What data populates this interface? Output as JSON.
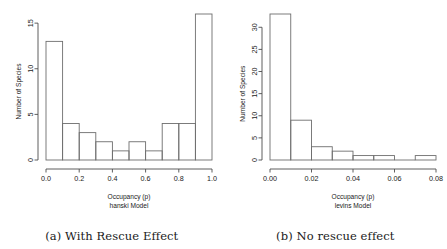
{
  "figure": {
    "panels": [
      {
        "id": "panel-a",
        "caption": "(a) With Rescue Effect",
        "xlabel_line1": "Occupancy (p)",
        "xlabel_line2": "hanski Model",
        "ylabel": "Number of Species"
      },
      {
        "id": "panel-b",
        "caption": "(b) No rescue effect",
        "xlabel_line1": "Occupancy (p)",
        "xlabel_line2": "levins Model",
        "ylabel": "Number of Species"
      }
    ]
  },
  "chart_data": [
    {
      "type": "bar",
      "subtype": "histogram",
      "title": "(a) With Rescue Effect",
      "xlabel": "Occupancy (p) hanski Model",
      "ylabel": "Number of Species",
      "xlim": [
        0.0,
        1.0
      ],
      "ylim": [
        0,
        16
      ],
      "xticks": [
        0.0,
        0.2,
        0.4,
        0.6,
        0.8,
        1.0
      ],
      "xticklabels": [
        "0.0",
        "0.2",
        "0.4",
        "0.6",
        "0.8",
        "1.0"
      ],
      "yticks": [
        0,
        5,
        10,
        15
      ],
      "yticklabels": [
        "0",
        "5",
        "10",
        "15"
      ],
      "grid": false,
      "legend": null,
      "bin_edges": [
        0.0,
        0.1,
        0.2,
        0.3,
        0.4,
        0.5,
        0.6,
        0.7,
        0.8,
        0.9,
        1.0
      ],
      "categories": [
        "0.0-0.1",
        "0.1-0.2",
        "0.2-0.3",
        "0.3-0.4",
        "0.4-0.5",
        "0.5-0.6",
        "0.6-0.7",
        "0.7-0.8",
        "0.8-0.9",
        "0.9-1.0"
      ],
      "values": [
        13,
        4,
        3,
        2,
        1,
        2,
        1,
        4,
        4,
        16
      ]
    },
    {
      "type": "bar",
      "subtype": "histogram",
      "title": "(b) No rescue effect",
      "xlabel": "Occupancy (p) levins Model",
      "ylabel": "Number of Species",
      "xlim": [
        0.0,
        0.08
      ],
      "ylim": [
        0,
        33
      ],
      "xticks": [
        0.0,
        0.02,
        0.04,
        0.06,
        0.08
      ],
      "xticklabels": [
        "0.00",
        "0.02",
        "0.04",
        "0.06",
        "0.08"
      ],
      "yticks": [
        0,
        5,
        10,
        15,
        20,
        25,
        30
      ],
      "yticklabels": [
        "0",
        "5",
        "10",
        "15",
        "20",
        "25",
        "30"
      ],
      "grid": false,
      "legend": null,
      "bin_edges": [
        0.0,
        0.01,
        0.02,
        0.03,
        0.04,
        0.05,
        0.06,
        0.07,
        0.08
      ],
      "categories": [
        "0.00-0.01",
        "0.01-0.02",
        "0.02-0.03",
        "0.03-0.04",
        "0.04-0.05",
        "0.05-0.06",
        "0.06-0.07",
        "0.07-0.08"
      ],
      "values": [
        33,
        9,
        3,
        2,
        1,
        1,
        0,
        1
      ]
    }
  ]
}
